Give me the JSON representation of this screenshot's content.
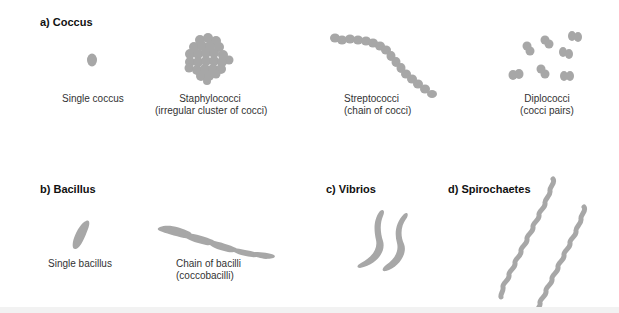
{
  "colors": {
    "cell_fill": "#a7a7a7",
    "cell_dark": "#999999",
    "background": "#ffffff",
    "bottom_band": "#f2f2f2"
  },
  "sections": {
    "coccus": {
      "heading": "a) Coccus",
      "items": [
        {
          "line1": "Single coccus",
          "line2": ""
        },
        {
          "line1": "Staphylococci",
          "line2": "(irregular cluster of cocci)"
        },
        {
          "line1": "Streptococci",
          "line2": "(chain of cocci)"
        },
        {
          "line1": "Diplococci",
          "line2": "(cocci pairs)"
        }
      ]
    },
    "bacillus": {
      "heading": "b) Bacillus",
      "items": [
        {
          "line1": "Single bacillus",
          "line2": ""
        },
        {
          "line1": "Chain of bacilli",
          "line2": "(coccobacilli)"
        }
      ]
    },
    "vibrios": {
      "heading": "c) Vibrios"
    },
    "spirochaetes": {
      "heading": "d) Spirochaetes"
    }
  }
}
